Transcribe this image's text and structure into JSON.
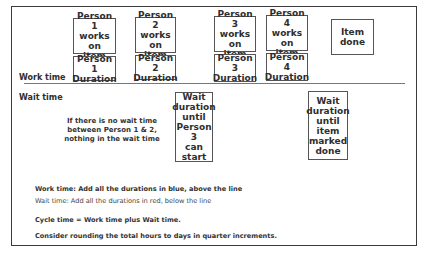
{
  "labels": {
    "work_time": "Work time",
    "wait_time": "Wait time"
  },
  "work_boxes": [
    {
      "action": "Person 1\nworks on\nitem",
      "duration": "Person 1\nDuration"
    },
    {
      "action": "Person 2\nworks on\nitem",
      "duration": "Person 2\nDuration"
    },
    {
      "action": "Person 3\nworks on\nitem",
      "duration": "Person 3\nDuration"
    },
    {
      "action": "Person 4\nworks on\nitem",
      "duration": "Person 4\nDuration"
    }
  ],
  "item_done": "Item done",
  "wait_boxes": [
    {
      "text": "Wait\nduration\nuntil\nPerson 3\ncan\nstart"
    },
    {
      "text": "Wait\nduration\nuntil\nitem\nmarked\ndone"
    }
  ],
  "note": "If there is no wait time\nbetween Person 1 & 2,\nnothing in the wait time",
  "instructions": {
    "work": "Work time: Add all the durations in blue, above the line",
    "wait": "Wait time: Add all the durations in red, below the line",
    "cycle": "Cycle time = Work time plus Wait time.",
    "rounding": "Consider rounding the total hours to days in quarter increments."
  }
}
